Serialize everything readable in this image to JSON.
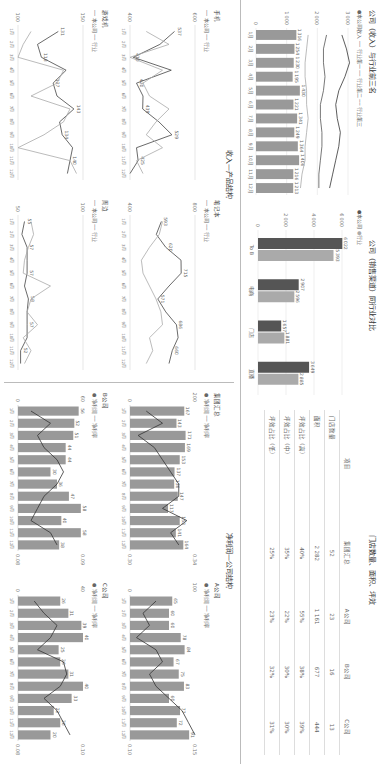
{
  "colors": {
    "company": "#555555",
    "industry": "#aaaaaa",
    "bar": "#999999",
    "line": "#444444"
  },
  "revenue_top3": {
    "title": "公司（收入）与行业前三名",
    "legend": [
      "本公司收入",
      "行业第一",
      "行业第二",
      "行业第三"
    ]
  },
  "channel": {
    "title": "公司（销售渠道）同行业对比",
    "legend": [
      "本公司",
      "行业"
    ]
  },
  "stores": {
    "title": "门店数量、面积、坪效",
    "headers": [
      "项目",
      "集团汇总",
      "A公司",
      "B公司",
      "C公司"
    ],
    "rows": [
      [
        "门店数量",
        "52",
        "23",
        "16",
        "13"
      ],
      [
        "面积",
        "2 282",
        "1 161",
        "677",
        "444"
      ],
      [
        "坪效占比（高）",
        "40%",
        "55%",
        "38%",
        "39%"
      ],
      [
        "坪效占比（中）",
        "35%",
        "22%",
        "30%",
        "30%"
      ],
      [
        "坪效占比（低）",
        "25%",
        "23%",
        "32%",
        "31%"
      ]
    ]
  },
  "product": {
    "title": "收入—产品结构",
    "legend": [
      "本公司",
      "行业"
    ],
    "charts": [
      "手机",
      "笔记本",
      "游戏机",
      "周边"
    ]
  },
  "profit": {
    "title": "净利润—公司结构",
    "legend": [
      "净利润",
      "净利率"
    ],
    "charts": [
      "集团汇总",
      "A公司",
      "B公司",
      "C公司"
    ]
  },
  "chart_data": [
    {
      "type": "bar",
      "title": "公司（收入）与行业前三名",
      "categories": [
        "1月",
        "2月",
        "3月",
        "4月",
        "5月",
        "6月",
        "7月",
        "8月",
        "9月",
        "10月",
        "11月",
        "12月"
      ],
      "series": [
        {
          "name": "本公司收入",
          "values": [
            1316,
            1254,
            1230,
            1195,
            1430,
            1221,
            1341,
            1249,
            1364,
            1406,
            1216,
            1213
          ]
        }
      ],
      "lines": [
        {
          "name": "行业第一",
          "values": [
            2800,
            2950,
            3050,
            2900,
            2700,
            2600,
            2650,
            2750,
            2700,
            2600,
            2500,
            2400
          ]
        },
        {
          "name": "行业第二",
          "values": [
            2300,
            2200,
            2200,
            2250,
            2200,
            2100,
            2100,
            2150,
            2150,
            2100,
            2050,
            2050
          ]
        },
        {
          "name": "行业第三",
          "values": [
            1700,
            1650,
            1600,
            1600,
            1650,
            1650,
            1700,
            1650,
            1600,
            1600,
            1500,
            1450
          ]
        }
      ],
      "ylim": [
        0,
        3000
      ],
      "yticks": [
        0,
        1000,
        2000,
        3000
      ]
    },
    {
      "type": "bar",
      "title": "公司（销售渠道）同行业对比",
      "categories": [
        "To B",
        "电商",
        "门店",
        "直播"
      ],
      "series": [
        {
          "name": "本公司",
          "values": [
            6022,
            2907,
            1657,
            3649
          ]
        },
        {
          "name": "行业",
          "values": [
            5393,
            2596,
            1881,
            2885
          ]
        }
      ],
      "ylim": [
        0,
        6000
      ],
      "yticks": [
        0,
        2000,
        4000,
        6000
      ]
    },
    {
      "type": "table",
      "title": "门店数量、面积、坪效",
      "headers": [
        "项目",
        "集团汇总",
        "A公司",
        "B公司",
        "C公司"
      ],
      "rows": [
        [
          "门店数量",
          "52",
          "23",
          "16",
          "13"
        ],
        [
          "面积",
          "2 282",
          "1 161",
          "677",
          "444"
        ],
        [
          "坪效占比（高）",
          "40%",
          "55%",
          "38%",
          "39%"
        ],
        [
          "坪效占比（中）",
          "35%",
          "22%",
          "30%",
          "30%"
        ],
        [
          "坪效占比（低）",
          "25%",
          "23%",
          "32%",
          "31%"
        ]
      ]
    },
    {
      "type": "line",
      "title": "手机",
      "categories": [
        "1月",
        "2月",
        "3月",
        "4月",
        "5月",
        "6月",
        "7月",
        "8月",
        "9月",
        "10月",
        "11月",
        "12月"
      ],
      "series": [
        {
          "name": "本公司",
          "values": [
            537,
            492,
            410,
            527,
            420,
            440,
            439,
            489,
            529,
            420,
            425,
            400
          ]
        },
        {
          "name": "行业",
          "values": [
            450,
            520,
            400,
            500,
            440,
            460,
            520,
            480,
            450,
            500,
            420,
            440
          ]
        }
      ],
      "ylim": [
        400,
        600
      ]
    },
    {
      "type": "line",
      "title": "笔记本",
      "categories": [
        "1月",
        "2月",
        "3月",
        "4月",
        "5月",
        "6月",
        "7月",
        "8月",
        "9月",
        "10月",
        "11月",
        "12月"
      ],
      "series": [
        {
          "name": "本公司",
          "values": [
            593,
            562,
            620,
            714,
            715,
            640,
            571,
            620,
            686,
            696,
            660,
            640
          ]
        },
        {
          "name": "行业",
          "values": [
            600,
            580,
            520,
            470,
            480,
            520,
            560,
            590,
            600,
            520,
            540,
            500
          ]
        }
      ],
      "ylim": [
        400,
        800
      ]
    },
    {
      "type": "line",
      "title": "游戏机",
      "categories": [
        "1月",
        "2月",
        "3月",
        "4月",
        "5月",
        "6月",
        "7月",
        "8月",
        "9月",
        "10月",
        "11月",
        "12月"
      ],
      "series": [
        {
          "name": "本公司",
          "values": [
            131,
            115,
            118,
            137,
            127,
            130,
            143,
            132,
            134,
            142,
            140,
            138
          ]
        },
        {
          "name": "行业",
          "values": [
            110,
            104,
            100,
            135,
            130,
            110,
            140,
            135,
            120,
            100,
            140,
            145
          ]
        }
      ],
      "ylim": [
        100,
        150
      ]
    },
    {
      "type": "line",
      "title": "周边",
      "categories": [
        "1月",
        "2月",
        "3月",
        "4月",
        "5月",
        "6月",
        "7月",
        "8月",
        "9月",
        "10月",
        "11月",
        "12月"
      ],
      "series": [
        {
          "name": "本公司",
          "values": [
            55,
            53,
            57,
            57,
            57,
            55,
            58,
            57,
            57,
            57,
            52,
            52
          ]
        },
        {
          "name": "行业",
          "values": [
            60,
            62,
            58,
            55,
            54,
            75,
            60,
            57,
            65,
            54,
            60,
            55
          ]
        }
      ],
      "ylim": [
        50,
        100
      ]
    },
    {
      "type": "bar",
      "title": "集团汇总",
      "categories": [
        "1月",
        "2月",
        "3月",
        "4月",
        "5月",
        "6月",
        "7月",
        "8月",
        "9月",
        "10月",
        "11月",
        "12月"
      ],
      "series": [
        {
          "name": "净利润",
          "values": [
            167,
            143,
            171,
            169,
            153,
            137,
            136,
            147,
            117,
            153,
            141,
            164
          ]
        }
      ],
      "lines": [
        {
          "name": "净利率",
          "values": [
            0.31,
            0.32,
            0.305,
            0.315,
            0.32,
            0.325,
            0.33,
            0.33,
            0.32,
            0.335,
            0.325,
            0.33
          ]
        }
      ],
      "ylim": [
        0,
        200
      ],
      "y2lim": [
        0.3,
        0.34
      ]
    },
    {
      "type": "bar",
      "title": "A公司",
      "categories": [
        "1月",
        "2月",
        "3月",
        "4月",
        "5月",
        "6月",
        "7月",
        "8月",
        "9月",
        "10月",
        "11月",
        "12月"
      ],
      "series": [
        {
          "name": "净利润",
          "values": [
            65,
            60,
            60,
            78,
            84,
            67,
            75,
            83,
            60,
            77,
            72,
            91
          ]
        }
      ],
      "lines": [
        {
          "name": "净利率",
          "values": [
            0.12,
            0.11,
            0.115,
            0.105,
            0.12,
            0.125,
            0.115,
            0.12,
            0.13,
            0.14,
            0.145,
            0.15
          ]
        }
      ],
      "ylim": [
        0,
        100
      ],
      "y2lim": [
        0.1,
        0.15
      ]
    },
    {
      "type": "bar",
      "title": "B公司",
      "categories": [
        "1月",
        "2月",
        "3月",
        "4月",
        "5月",
        "6月",
        "7月",
        "8月",
        "9月",
        "10月",
        "11月",
        "12月"
      ],
      "series": [
        {
          "name": "净利润",
          "values": [
            56,
            52,
            51,
            44,
            44,
            30,
            36,
            47,
            58,
            40,
            58,
            38
          ]
        }
      ],
      "lines": [
        {
          "name": "净利率",
          "values": [
            0.082,
            0.085,
            0.083,
            0.084,
            0.086,
            0.087,
            0.086,
            0.084,
            0.083,
            0.082,
            0.085,
            0.086
          ]
        }
      ],
      "ylim": [
        0,
        60
      ],
      "y2lim": [
        0.08,
        0.09
      ]
    },
    {
      "type": "bar",
      "title": "C公司",
      "categories": [
        "1月",
        "2月",
        "3月",
        "4月",
        "5月",
        "6月",
        "7月",
        "8月",
        "9月",
        "10月",
        "11月",
        "12月"
      ],
      "series": [
        {
          "name": "净利润",
          "values": [
            26,
            31,
            39,
            40,
            25,
            26,
            31,
            40,
            33,
            22,
            26,
            20
          ]
        }
      ],
      "lines": [
        {
          "name": "净利率",
          "values": [
            0.085,
            0.088,
            0.092,
            0.09,
            0.086,
            0.094,
            0.095,
            0.093,
            0.088,
            0.092,
            0.094,
            0.096
          ]
        }
      ],
      "ylim": [
        0,
        40
      ],
      "y2lim": [
        0.08,
        0.1
      ]
    }
  ]
}
